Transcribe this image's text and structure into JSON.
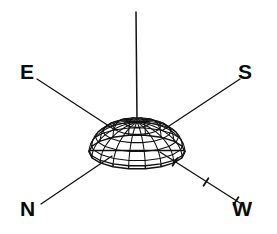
{
  "figure": {
    "background_color": "#ffffff",
    "stroke_color": "#111111",
    "label_color": "#0b0b0b",
    "width": 277,
    "height": 234
  },
  "compass_labels": [
    {
      "id": "E",
      "text": "E",
      "x": 20,
      "y": 73,
      "corner": "upper-left"
    },
    {
      "id": "S",
      "text": "S",
      "x": 252,
      "y": 73,
      "corner": "upper-right"
    },
    {
      "id": "N",
      "text": "N",
      "x": 20,
      "y": 210,
      "corner": "lower-left"
    },
    {
      "id": "W",
      "text": "W",
      "x": 252,
      "y": 210,
      "corner": "lower-right"
    }
  ],
  "axes": {
    "vertical": {
      "id": "z-axis",
      "x1": 136,
      "y1": 12,
      "x2": 137,
      "y2": 120
    },
    "diagonals": [
      {
        "id": "axis-E",
        "label": "E",
        "x1": 37,
        "y1": 79,
        "x2": 115,
        "y2": 130
      },
      {
        "id": "axis-S",
        "label": "S",
        "x1": 240,
        "y1": 79,
        "x2": 163,
        "y2": 130
      },
      {
        "id": "axis-N",
        "label": "N",
        "x1": 41,
        "y1": 204,
        "x2": 112,
        "y2": 156
      },
      {
        "id": "axis-W",
        "label": "W",
        "x1": 160,
        "y1": 152,
        "x2": 240,
        "y2": 203
      }
    ]
  },
  "tick_marks": {
    "on_axis": "W",
    "count": 3,
    "positions": [
      {
        "index": 1,
        "x": 175,
        "y": 162
      },
      {
        "index": 2,
        "x": 206,
        "y": 182
      },
      {
        "index": 3,
        "x": 236,
        "y": 201
      }
    ],
    "length": 9
  },
  "dome": {
    "type": "wireframe-hemisphere",
    "apex_x": 137,
    "apex_y": 118,
    "radius_x": 48,
    "radius_y": 17,
    "height": 30,
    "base_y": 152,
    "meridians": 18,
    "parallels": 6,
    "left_edge": 89,
    "right_edge": 185,
    "bottom_edge": 166
  },
  "chart_data": {
    "type": "line",
    "xlabel": "",
    "ylabel": "",
    "legend_position": "none",
    "grid": false,
    "annotations": [
      "E",
      "S",
      "N",
      "W"
    ],
    "series": [
      {
        "name": "dome-meridians",
        "values": [
          18
        ]
      },
      {
        "name": "dome-parallels",
        "values": [
          6
        ]
      },
      {
        "name": "w-axis-ticks",
        "values": [
          1,
          2,
          3
        ]
      }
    ]
  }
}
